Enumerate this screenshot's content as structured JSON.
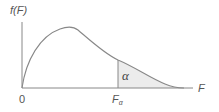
{
  "diagram": {
    "title": "",
    "y_axis_label": "f(F)",
    "x_axis_label": "F",
    "origin_label": "0",
    "critical_value_label": {
      "main": "F",
      "subscript": "α"
    },
    "shaded_area_label": "α",
    "colors": {
      "curve": "#888888",
      "axes": "#888888",
      "shade": "#ececec",
      "text": "#555555"
    }
  }
}
